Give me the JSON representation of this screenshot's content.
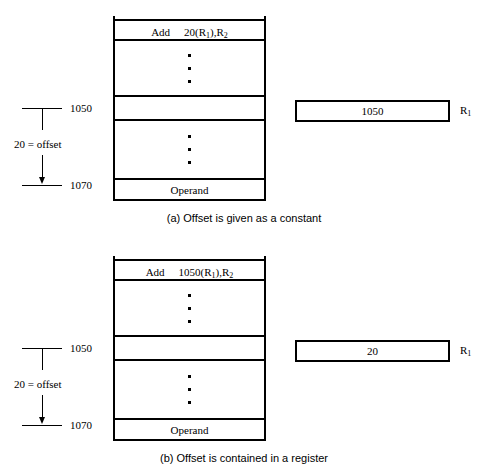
{
  "figure": {
    "ink_color": "#000000",
    "background_color": "#ffffff"
  },
  "panels": [
    {
      "id": "a",
      "caption": "(a) Offset is given as a constant",
      "caption_visible": true,
      "memory": {
        "rows": [
          {
            "kind": "instruction",
            "mnemonic": "Add",
            "operands_prefix": "20(R",
            "register_sub": "1",
            "operands_suffix": "),R",
            "dest_sub": "2"
          },
          {
            "kind": "dots",
            "dot_count": 3
          },
          {
            "kind": "blank",
            "address_label": "1050"
          },
          {
            "kind": "dots",
            "dot_count": 3
          },
          {
            "kind": "operand",
            "text": "Operand",
            "address_label": "1070"
          }
        ]
      },
      "annotation": {
        "top_address": "1050",
        "bottom_address": "1070",
        "offset_label": "20 = offset",
        "arrow_direction": "down"
      },
      "register": {
        "name_prefix": "R",
        "name_sub": "1",
        "value": "1050"
      }
    },
    {
      "id": "b",
      "caption": "(b) Offset is contained in a register",
      "caption_visible": false,
      "memory": {
        "rows": [
          {
            "kind": "instruction",
            "mnemonic": "Add",
            "operands_prefix": "1050(R",
            "register_sub": "1",
            "operands_suffix": "),R",
            "dest_sub": "2"
          },
          {
            "kind": "dots",
            "dot_count": 3
          },
          {
            "kind": "blank",
            "address_label": "1050"
          },
          {
            "kind": "dots",
            "dot_count": 3
          },
          {
            "kind": "operand",
            "text": "Operand",
            "address_label": "1070"
          }
        ]
      },
      "annotation": {
        "top_address": "1050",
        "bottom_address": "1070",
        "offset_label": "20 = offset",
        "arrow_direction": "down"
      },
      "register": {
        "name_prefix": "R",
        "name_sub": "1",
        "value": "20"
      }
    }
  ]
}
